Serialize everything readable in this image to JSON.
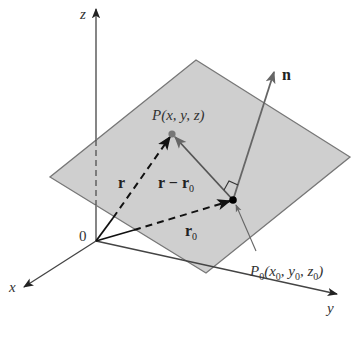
{
  "figure": {
    "colors": {
      "background": "#ffffff",
      "plane_fill": "#cfcfcf",
      "plane_edge": "#777777",
      "axis": "#444444",
      "vector": "#111111",
      "normal": "#666666",
      "point_P": "#777777",
      "point_P0": "#000000"
    },
    "axes": {
      "z": {
        "label": "z"
      },
      "x": {
        "label": "x"
      },
      "y": {
        "label": "y"
      },
      "origin": {
        "label": "0"
      }
    },
    "points": {
      "P": {
        "label": "P(x, y, z)"
      },
      "P0": {
        "label_main": "P",
        "label_sub": "0",
        "label_rest_1": "(x",
        "sub1": "0",
        "label_rest_2": ", y",
        "sub2": "0",
        "label_rest_3": ", z",
        "sub3": "0",
        "label_end": ")"
      }
    },
    "vectors": {
      "r": {
        "label": "r"
      },
      "r0": {
        "label_main": "r",
        "label_sub": "0"
      },
      "r_minus_r0": {
        "label_main": "r − r",
        "label_sub": "0"
      },
      "n": {
        "label": "n"
      }
    }
  }
}
